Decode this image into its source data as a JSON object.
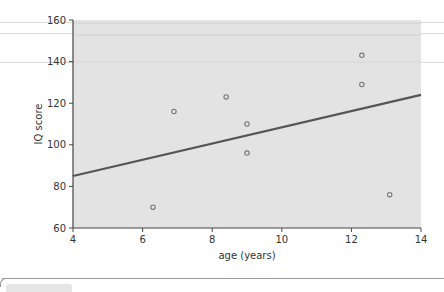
{
  "chart_data": {
    "type": "scatter",
    "title": "",
    "xlabel": "age (years)",
    "ylabel": "IQ score",
    "xlim": [
      4,
      14
    ],
    "ylim": [
      60,
      160
    ],
    "x_ticks": [
      4,
      6,
      8,
      10,
      12,
      14
    ],
    "y_ticks": [
      60,
      80,
      100,
      120,
      140,
      160
    ],
    "grid": false,
    "legend": null,
    "series": [
      {
        "name": "observations",
        "points": [
          {
            "x": 6.3,
            "y": 70
          },
          {
            "x": 6.9,
            "y": 116
          },
          {
            "x": 8.4,
            "y": 123
          },
          {
            "x": 9.0,
            "y": 110
          },
          {
            "x": 9.0,
            "y": 96
          },
          {
            "x": 12.3,
            "y": 143
          },
          {
            "x": 12.3,
            "y": 129
          },
          {
            "x": 13.1,
            "y": 76
          }
        ]
      },
      {
        "name": "regression line",
        "type": "line",
        "points": [
          {
            "x": 4,
            "y": 85
          },
          {
            "x": 14,
            "y": 124
          }
        ]
      }
    ]
  },
  "labels": {
    "xlabel": "age (years)",
    "ylabel": "IQ score",
    "x_ticks": [
      "4",
      "6",
      "8",
      "10",
      "12",
      "14"
    ],
    "y_ticks": [
      "160",
      "140",
      "120",
      "100",
      "80",
      "60"
    ]
  },
  "colors": {
    "plot_bg": "#e3e3e3",
    "line": "#555555",
    "marker": "#777777"
  }
}
